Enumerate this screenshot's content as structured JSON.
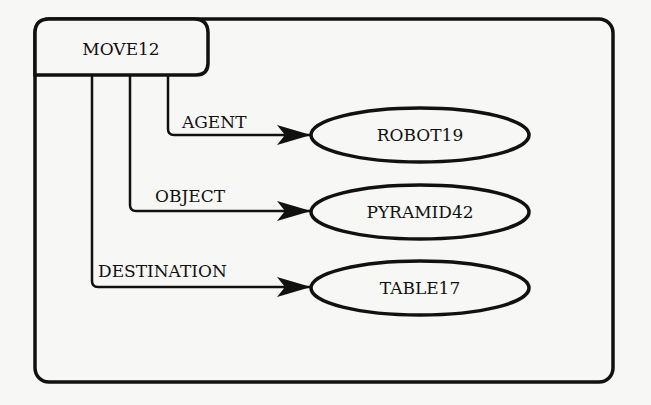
{
  "diagram": {
    "type": "semantic-network",
    "frame": {
      "x": 35,
      "y": 19,
      "width": 578,
      "height": 363
    },
    "root": {
      "label": "MOVE12",
      "x": 35,
      "y": 19,
      "width": 173,
      "height": 56
    },
    "edges": [
      {
        "label": "AGENT",
        "target": "ROBOT19",
        "x_vertical": 168,
        "y": 135,
        "label_x": 182,
        "label_y": 128
      },
      {
        "label": "OBJECT",
        "target": "PYRAMID42",
        "x_vertical": 130,
        "y": 211,
        "label_x": 155,
        "label_y": 202
      },
      {
        "label": "DESTINATION",
        "target": "TABLE17",
        "x_vertical": 92,
        "y": 287,
        "label_x": 98,
        "label_y": 277
      }
    ],
    "nodes": [
      {
        "label": "ROBOT19",
        "cx": 420,
        "cy": 135,
        "rx": 109,
        "ry": 27
      },
      {
        "label": "PYRAMID42",
        "cx": 420,
        "cy": 212,
        "rx": 109,
        "ry": 27
      },
      {
        "label": "TABLE17",
        "cx": 420,
        "cy": 288,
        "rx": 109,
        "ry": 27
      }
    ],
    "colors": {
      "stroke": "#111111",
      "background": "#f7f7f5"
    }
  }
}
